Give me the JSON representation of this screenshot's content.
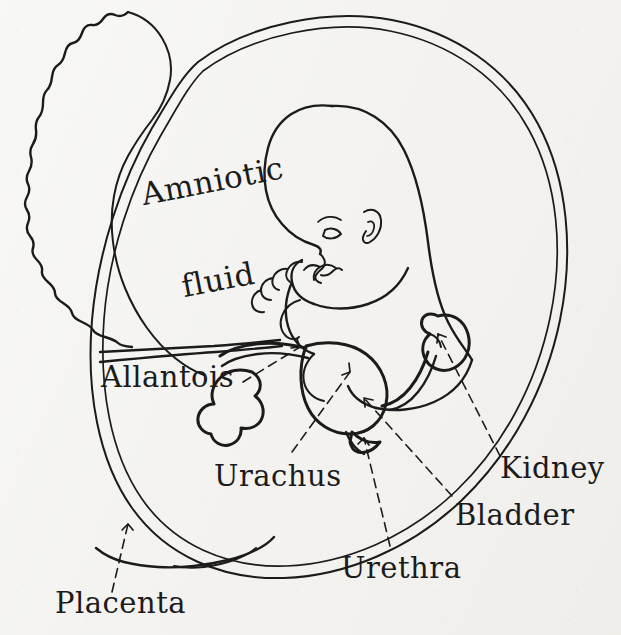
{
  "figure": {
    "background_color": "#f3f2ef",
    "ink_color": "#1b1b1b",
    "width": 621,
    "height": 635,
    "medium": "hand-drawn pen-and-ink line diagram on paper"
  },
  "labels": {
    "amniotic_fluid_line1": "Amniotic",
    "amniotic_fluid_line2": "fluid",
    "allantois": "Allantois",
    "urachus": "Urachus",
    "kidney": "Kidney",
    "bladder": "Bladder",
    "urethra": "Urethra",
    "placenta": "Placenta"
  },
  "structures": [
    {
      "name": "placenta",
      "label": "Placenta",
      "description": "crescent-shaped organ with scalloped outer border along left margin"
    },
    {
      "name": "amniotic-sac",
      "label": "Amniotic fluid",
      "description": "large double-outlined oval enclosing the fetus"
    },
    {
      "name": "fetus",
      "label": "",
      "description": "curled fetus facing left with hands near the mouth"
    },
    {
      "name": "allantois",
      "label": "Allantois",
      "description": "lobulated sac at lower left of the urinary group"
    },
    {
      "name": "urachus",
      "label": "Urachus",
      "description": "tubular duct running from bladder apex toward umbilicus"
    },
    {
      "name": "bladder",
      "label": "Bladder",
      "description": "pear-shaped reservoir at center of the urinary group"
    },
    {
      "name": "urethra",
      "label": "Urethra",
      "description": "short outflow channel below the bladder"
    },
    {
      "name": "kidney",
      "label": "Kidney",
      "description": "bean-shaped organ at upper right of the urinary group"
    }
  ],
  "leader_lines": [
    {
      "from": "Allantois",
      "to": "allantois",
      "style": "dashed-with-arrowhead"
    },
    {
      "from": "Urachus",
      "to": "urachus",
      "style": "dashed-with-arrowhead"
    },
    {
      "from": "Kidney",
      "to": "kidney",
      "style": "dashed-with-arrowhead"
    },
    {
      "from": "Bladder",
      "to": "bladder",
      "style": "dashed-with-arrowhead"
    },
    {
      "from": "Urethra",
      "to": "urethra",
      "style": "dashed-with-arrowhead"
    },
    {
      "from": "Placenta",
      "to": "placenta",
      "style": "dashed-with-arrowhead"
    }
  ]
}
